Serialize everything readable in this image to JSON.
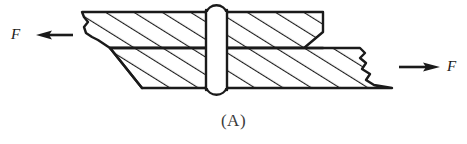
{
  "figure": {
    "caption": "(A)",
    "colors": {
      "line": "#1a1a1a",
      "background": "#ffffff",
      "caption_text": "#3a3a3a",
      "hatch": "#1a1a1a"
    }
  },
  "labels": {
    "force_left": "F",
    "force_right": "F"
  },
  "arrows": {
    "left": {
      "name": "force-arrow-left",
      "direction": "left",
      "tail_x": 73,
      "tail_y": 35,
      "head_x": 38,
      "head_y": 35
    },
    "right": {
      "name": "force-arrow-right",
      "direction": "right",
      "tail_x": 399,
      "tail_y": 67,
      "head_x": 437,
      "head_y": 67
    }
  },
  "parts": {
    "upper_plate": {
      "name": "upper-plate",
      "top_y": 12,
      "bottom_y": 48,
      "left_x": 78,
      "right_x": 323,
      "hatched": true
    },
    "lower_plate": {
      "name": "lower-plate",
      "top_y": 48,
      "bottom_y": 88,
      "left_x": 108,
      "right_x": 392,
      "hatched": true
    },
    "rivet": {
      "name": "rivet",
      "center_x": 216,
      "shank_left_x": 206,
      "shank_right_x": 227,
      "top_head_y": 12,
      "bottom_head_y": 88,
      "head_radius": 11
    }
  },
  "hatching": {
    "angle_deg": 58,
    "spacing_px": 15,
    "stroke_width": 2
  },
  "break_lines": {
    "left": {
      "name": "break-line-left",
      "x": 80
    },
    "right": {
      "name": "break-line-right",
      "x": 370
    }
  }
}
